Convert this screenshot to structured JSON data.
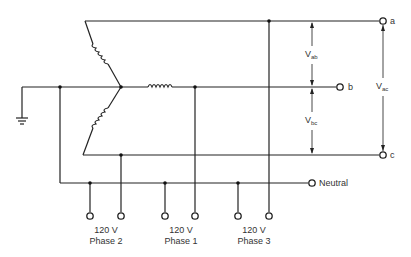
{
  "diagram": {
    "title": "",
    "type": "three-phase wye source with single-phase 120 V taps",
    "terminals": {
      "a": "a",
      "b": "b",
      "c": "c",
      "neutral": "Neutral"
    },
    "voltages": {
      "vab": {
        "main": "V",
        "sub": "ab"
      },
      "vbc": {
        "main": "V",
        "sub": "bc"
      },
      "vac": {
        "main": "V",
        "sub": "ac"
      }
    },
    "outputs": [
      {
        "voltage": "120 V",
        "phase": "Phase 2"
      },
      {
        "voltage": "120 V",
        "phase": "Phase 1"
      },
      {
        "voltage": "120 V",
        "phase": "Phase 3"
      }
    ],
    "symbols": {
      "ground": "ground-icon",
      "coil": "inductor-coil-icon",
      "terminal": "open-terminal-icon",
      "junction": "junction-dot-icon"
    },
    "colors": {
      "line": "#222222",
      "background": "#ffffff"
    }
  }
}
